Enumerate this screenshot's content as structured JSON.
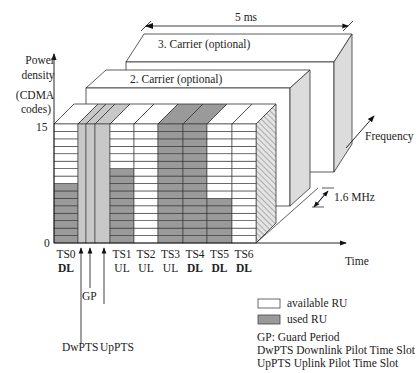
{
  "axis": {
    "y_label_line1": "Power",
    "y_label_line2": "density",
    "y_unit_line1": "(CDMA",
    "y_unit_line2": "codes)",
    "y_max": "15",
    "y_min": "0",
    "x_label": "Time",
    "z_label": "Frequency"
  },
  "frame_duration": "5 ms",
  "carrier_bandwidth": "1.6 MHz",
  "carriers": [
    {
      "label": "3. Carrier (optional)"
    },
    {
      "label": "2. Carrier (optional)"
    }
  ],
  "grid": {
    "rows": 16,
    "colors": {
      "available": "#ffffff",
      "used": "#9a9a9a",
      "special": "#c8c8c8",
      "line": "#333333"
    }
  },
  "slots": [
    {
      "name": "TS0",
      "dir": "DL",
      "used": 8
    },
    {
      "name": "TS1",
      "dir": "UL",
      "used": 10
    },
    {
      "name": "TS2",
      "dir": "UL",
      "used": 0
    },
    {
      "name": "TS3",
      "dir": "UL",
      "used": 16
    },
    {
      "name": "TS4",
      "dir": "DL",
      "used": 16
    },
    {
      "name": "TS5",
      "dir": "DL",
      "used": 6
    },
    {
      "name": "TS6",
      "dir": "DL",
      "used": 0
    }
  ],
  "special_fields": [
    {
      "name": "DwPTS"
    },
    {
      "name": "GP"
    },
    {
      "name": "UpPTS"
    }
  ],
  "legend": {
    "available": "available RU",
    "used": "used RU",
    "notes": [
      "GP: Guard Period",
      "DwPTS Downlink Pilot Time Slot",
      "UpPTS Uplink Pilot Time Slot"
    ]
  }
}
